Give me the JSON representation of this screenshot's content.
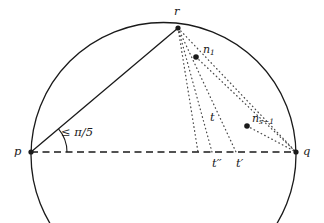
{
  "figure": {
    "name": "circle-chord-angle-diagram",
    "stroke_color": "#1a1a1a",
    "background_color": "#ffffff"
  },
  "points": {
    "p": {
      "label": "p",
      "x": 31,
      "y": 152,
      "label_x": 14,
      "label_y": 146
    },
    "q": {
      "label": "q",
      "x": 296,
      "y": 152,
      "label_x": 303,
      "label_y": 146
    },
    "r": {
      "label": "r",
      "x": 178,
      "y": 28,
      "label_x": 174,
      "label_y": 6
    },
    "n1": {
      "label": "n",
      "subscript": "1",
      "x": 196,
      "y": 57,
      "label_x": 203,
      "label_y": 44
    },
    "ns": {
      "label": "n",
      "subscript": "s−1",
      "x": 247,
      "y": 126,
      "label_x": 252,
      "label_y": 113
    }
  },
  "axis_labels": {
    "t": {
      "label": "t",
      "x": 210,
      "y": 112
    },
    "t_prime": {
      "label": "t",
      "prime": "′",
      "x": 236,
      "y": 158
    },
    "t_double_prime": {
      "label": "t",
      "prime": "′′",
      "x": 212,
      "y": 158
    }
  },
  "angle": {
    "label_prefix": "≤ ",
    "label_value": "π/5",
    "label_x": 61,
    "label_y": 127,
    "vertex": "p",
    "arc_radius": 36
  },
  "geometry": {
    "circle": {
      "cx": 163.5,
      "cy": 155,
      "r": 132.5
    },
    "chord_pq": {
      "x1": 31,
      "y1": 152,
      "x2": 296,
      "y2": 152,
      "style": "dashed"
    },
    "chord_pr": {
      "x1": 31,
      "y1": 152,
      "x2": 178,
      "y2": 28,
      "style": "solid"
    },
    "dotted_rays_from_r": [
      {
        "to_x": 212,
        "to_y": 152,
        "name": "r-to-t-double-prime"
      },
      {
        "to_x": 236,
        "to_y": 152,
        "name": "r-to-t-prime"
      },
      {
        "to_x": 296,
        "to_y": 152,
        "name": "r-to-q"
      }
    ],
    "dotted_node_rays": [
      {
        "from_x": 196,
        "from_y": 57,
        "to_x": 296,
        "to_y": 152,
        "name": "n1-to-q"
      },
      {
        "from_x": 247,
        "from_y": 126,
        "to_x": 296,
        "to_y": 152,
        "name": "ns-to-q"
      }
    ]
  }
}
